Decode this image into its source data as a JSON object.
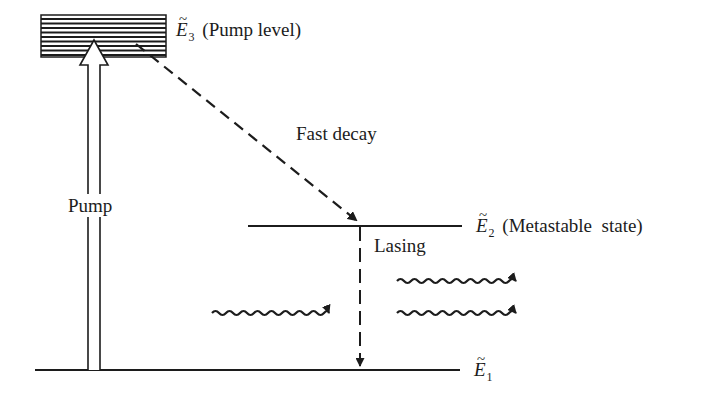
{
  "diagram": {
    "type": "three-level laser energy diagram",
    "colors": {
      "ink": "#1c1c1c",
      "background": "#ffffff"
    },
    "levels": [
      {
        "id": "E3",
        "symbol": "E",
        "tilde": "~",
        "subscript": "3",
        "description": "(Pump level)",
        "y": 36
      },
      {
        "id": "E2",
        "symbol": "E",
        "tilde": "~",
        "subscript": "2",
        "description": "(Metastable  state)",
        "y": 226
      },
      {
        "id": "E1",
        "symbol": "E",
        "tilde": "~",
        "subscript": "1",
        "description": "",
        "y": 370
      }
    ],
    "transitions": [
      {
        "id": "pump",
        "label": "Pump",
        "from": "E1",
        "to": "E3",
        "style": "hollow-arrow"
      },
      {
        "id": "fast-decay",
        "label": "Fast decay",
        "from": "E3",
        "to": "E2",
        "style": "dashed-arrow"
      },
      {
        "id": "lasing",
        "label": "Lasing",
        "from": "E2",
        "to": "E1",
        "style": "dashed-arrow"
      }
    ],
    "photons": [
      {
        "id": "incident-photon",
        "direction": "right"
      },
      {
        "id": "emitted-photon-1",
        "direction": "right"
      },
      {
        "id": "emitted-photon-2",
        "direction": "right"
      }
    ]
  }
}
